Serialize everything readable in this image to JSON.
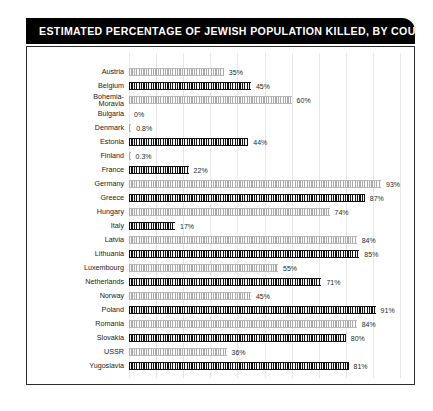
{
  "header": {
    "title": "ESTIMATED PERCENTAGE OF JEWISH POPULATION KILLED, BY COUNTRY"
  },
  "colors": {
    "banner_background": "#000000",
    "banner_text": "#ffffff",
    "frame_border": "#2b2b2b",
    "bar_dark": "#111111",
    "bar_light": "#a9a9a9",
    "gridline": "#e8e8e8",
    "label_text": "#1a1a1a",
    "value_text": "#2a2a2a"
  },
  "chart_data": {
    "type": "bar",
    "orientation": "horizontal",
    "title": "ESTIMATED PERCENTAGE OF JEWISH POPULATION KILLED, BY COUNTRY",
    "xlabel": "",
    "ylabel": "",
    "xlim": [
      0,
      100
    ],
    "grid": true,
    "grid_step": 10,
    "legend": null,
    "value_suffix": "%",
    "categories": [
      "Austria",
      "Bohemia-Moravia",
      "Belgium",
      "Bulgaria",
      "Denmark",
      "Estonia",
      "Finland",
      "France",
      "Germany",
      "Greece",
      "Hungary",
      "Italy",
      "Latvia",
      "Lithuania",
      "Luxembourg",
      "Netherlands",
      "Norway",
      "Poland",
      "Romania",
      "Slovakia",
      "USSR",
      "Yugoslavia"
    ],
    "values": [
      35,
      45,
      60,
      0,
      0.8,
      44,
      0.3,
      22,
      93,
      87,
      74,
      17,
      84,
      85,
      55,
      71,
      45,
      91,
      84,
      80,
      36,
      81
    ]
  },
  "rows": [
    {
      "label": "Austria",
      "value": 35,
      "value_label": "35%",
      "shade": "light"
    },
    {
      "label": "Belgium",
      "value": 45,
      "value_label": "45%",
      "shade": "dark"
    },
    {
      "label": "Bohemia-\nMoravia",
      "value": 60,
      "value_label": "60%",
      "shade": "light"
    },
    {
      "label": "Bulgaria",
      "value": 0,
      "value_label": "0%",
      "shade": "dark"
    },
    {
      "label": "Denmark",
      "value": 0.8,
      "value_label": "0.8%",
      "shade": "light"
    },
    {
      "label": "Estonia",
      "value": 44,
      "value_label": "44%",
      "shade": "dark"
    },
    {
      "label": "Finland",
      "value": 0.3,
      "value_label": "0.3%",
      "shade": "light"
    },
    {
      "label": "France",
      "value": 22,
      "value_label": "22%",
      "shade": "dark"
    },
    {
      "label": "Germany",
      "value": 93,
      "value_label": "93%",
      "shade": "light"
    },
    {
      "label": "Greece",
      "value": 87,
      "value_label": "87%",
      "shade": "dark"
    },
    {
      "label": "Hungary",
      "value": 74,
      "value_label": "74%",
      "shade": "light"
    },
    {
      "label": "Italy",
      "value": 17,
      "value_label": "17%",
      "shade": "dark"
    },
    {
      "label": "Latvia",
      "value": 84,
      "value_label": "84%",
      "shade": "light"
    },
    {
      "label": "Lithuania",
      "value": 85,
      "value_label": "85%",
      "shade": "dark"
    },
    {
      "label": "Luxembourg",
      "value": 55,
      "value_label": "55%",
      "shade": "light"
    },
    {
      "label": "Netherlands",
      "value": 71,
      "value_label": "71%",
      "shade": "dark"
    },
    {
      "label": "Norway",
      "value": 45,
      "value_label": "45%",
      "shade": "light"
    },
    {
      "label": "Poland",
      "value": 91,
      "value_label": "91%",
      "shade": "dark"
    },
    {
      "label": "Romania",
      "value": 84,
      "value_label": "84%",
      "shade": "light"
    },
    {
      "label": "Slovakia",
      "value": 80,
      "value_label": "80%",
      "shade": "dark"
    },
    {
      "label": "USSR",
      "value": 36,
      "value_label": "36%",
      "shade": "light"
    },
    {
      "label": "Yugoslavia",
      "value": 81,
      "value_label": "81%",
      "shade": "dark"
    }
  ]
}
